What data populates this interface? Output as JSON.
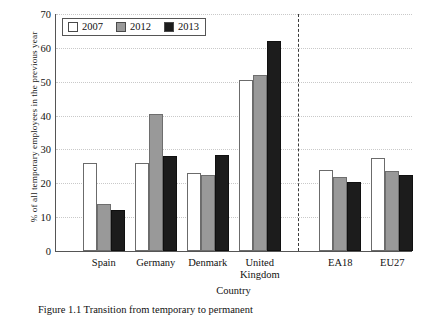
{
  "chart_data": {
    "type": "bar",
    "title": "",
    "xlabel": "Country",
    "ylabel": "% of all temporary employees in the previous year",
    "ylim": [
      0,
      70
    ],
    "yticks": [
      0,
      10,
      20,
      30,
      40,
      50,
      60,
      70
    ],
    "grid": true,
    "legend_position": "top-left",
    "categories": [
      "Spain",
      "Germany",
      "Denmark",
      "United\nKingdom",
      "EA18",
      "EU27"
    ],
    "series": [
      {
        "name": "2007",
        "color": "#ffffff",
        "values": [
          26,
          26,
          23,
          50.5,
          24,
          27.5
        ]
      },
      {
        "name": "2012",
        "color": "#999999",
        "values": [
          14,
          40.5,
          22.5,
          52,
          22,
          23.5
        ]
      },
      {
        "name": "2013",
        "color": "#1c1c1c",
        "values": [
          12,
          28,
          28.5,
          62,
          20.5,
          22.5
        ]
      }
    ],
    "annotations": [
      {
        "type": "vertical-dashed-separator",
        "after_category": "United\nKingdom"
      }
    ]
  },
  "caption": "Figure 1.1   Transition from temporary to permanent",
  "legend": {
    "items": [
      {
        "label": "2007"
      },
      {
        "label": "2012"
      },
      {
        "label": "2013"
      }
    ]
  }
}
